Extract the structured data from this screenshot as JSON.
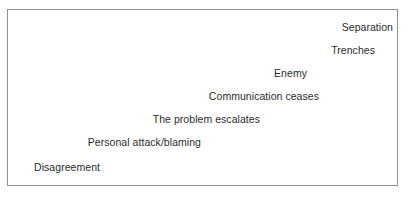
{
  "figure": {
    "name": "conflict-escalation-staircase",
    "background_color": "#ffffff",
    "border_color": "#8f9194",
    "text_color": "#2b2b2b"
  },
  "diagram_data": {
    "type": "staircase",
    "description": "Descending staircase of conflict escalation stages, read bottom-left upward to top-right",
    "steps": [
      {
        "level": 7,
        "label": "Separation"
      },
      {
        "level": 6,
        "label": "Trenches"
      },
      {
        "level": 5,
        "label": "Enemy"
      },
      {
        "level": 4,
        "label": "Communication ceases"
      },
      {
        "level": 3,
        "label": "The problem escalates"
      },
      {
        "level": 2,
        "label": "Personal attack/blaming"
      },
      {
        "level": 1,
        "label": "Disagreement"
      }
    ]
  }
}
